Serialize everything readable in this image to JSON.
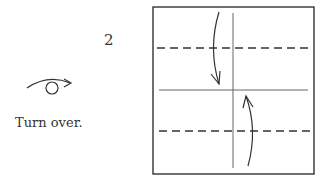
{
  "step": {
    "number": "2",
    "instruction": "Turn over.",
    "symbol": "turn-over"
  },
  "diagram": {
    "square": {
      "x": 153,
      "y": 7,
      "width": 161,
      "height": 167
    },
    "creases": {
      "vertical_center": {
        "x": 233,
        "y1": 13,
        "y2": 168,
        "style": "solid"
      },
      "horizontal_center": {
        "y": 90,
        "x1": 159,
        "x2": 308,
        "style": "solid"
      }
    },
    "fold_lines": [
      {
        "y": 48,
        "style": "dashed",
        "type": "valley-fold"
      },
      {
        "y": 131,
        "style": "dashed",
        "type": "valley-fold"
      }
    ],
    "arrows": [
      {
        "direction": "down",
        "from": [
          218,
          12
        ],
        "to": [
          219,
          84
        ]
      },
      {
        "direction": "up",
        "from": [
          248,
          166
        ],
        "to": [
          246,
          96
        ]
      }
    ],
    "colors": {
      "line": "#333333",
      "background": "#ffffff"
    }
  }
}
